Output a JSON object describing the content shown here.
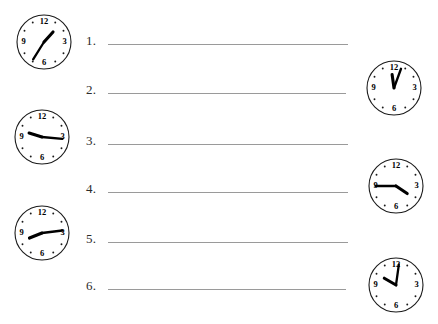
{
  "worksheet": {
    "title": "Telling Time Worksheet",
    "background_color": "#ffffff",
    "line_color": "#9a9a9a",
    "ink_color": "#000000"
  },
  "questions": [
    {
      "number": "1.",
      "answer_value": "",
      "placeholder": ""
    },
    {
      "number": "2.",
      "answer_value": "",
      "placeholder": ""
    },
    {
      "number": "3.",
      "answer_value": "",
      "placeholder": ""
    },
    {
      "number": "4.",
      "answer_value": "",
      "placeholder": ""
    },
    {
      "number": "5.",
      "answer_value": "",
      "placeholder": ""
    },
    {
      "number": "6.",
      "answer_value": "",
      "placeholder": ""
    }
  ],
  "clock_numerals": [
    "12",
    "3",
    "6",
    "9"
  ],
  "clocks": [
    {
      "id": "clock-1",
      "column": "left",
      "hour_angle": 42,
      "minute_angle": 212,
      "reading": "1:35"
    },
    {
      "id": "clock-2",
      "column": "left",
      "hour_angle": 287,
      "minute_angle": 95,
      "reading": "9:16"
    },
    {
      "id": "clock-3",
      "column": "left",
      "hour_angle": 248,
      "minute_angle": 83,
      "reading": "8:15"
    },
    {
      "id": "clock-4",
      "column": "right",
      "hour_angle": 352,
      "minute_angle": 20,
      "reading": "12:02"
    },
    {
      "id": "clock-5",
      "column": "right",
      "hour_angle": 124,
      "minute_angle": 270,
      "reading": "3:45"
    },
    {
      "id": "clock-6",
      "column": "right",
      "hour_angle": 300,
      "minute_angle": 8,
      "reading": "10:00"
    }
  ]
}
